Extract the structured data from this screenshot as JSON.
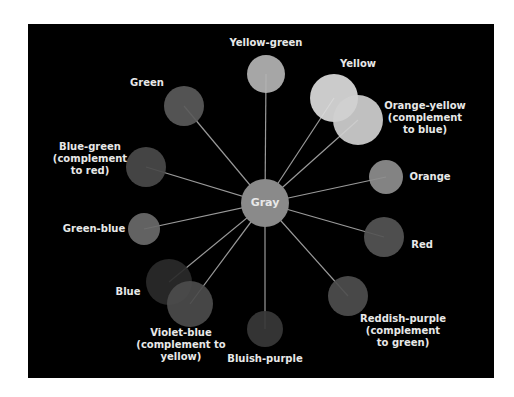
{
  "diagram": {
    "center": {
      "label": "Gray",
      "x": 265,
      "y": 203,
      "r": 24,
      "color": "#8a8a8a"
    },
    "nodes": [
      {
        "id": "yellow-green",
        "label": "Yellow-green",
        "x": 266,
        "y": 74,
        "r": 19,
        "color": "#b4b4b4",
        "lx": 266,
        "ly": 43
      },
      {
        "id": "yellow",
        "label": "Yellow",
        "x": 334,
        "y": 98,
        "r": 24,
        "color": "#dcdcdc",
        "lx": 358,
        "ly": 64
      },
      {
        "id": "orange-yellow",
        "label": "Orange-yellow\n(complement\nto blue)",
        "x": 358,
        "y": 120,
        "r": 25,
        "color": "#d0d0d0",
        "lx": 425,
        "ly": 118
      },
      {
        "id": "green",
        "label": "Green",
        "x": 184,
        "y": 106,
        "r": 20,
        "color": "#5a5a5a",
        "lx": 147,
        "ly": 83
      },
      {
        "id": "blue-green",
        "label": "Blue-green\n(complement\nto red)",
        "x": 146,
        "y": 167,
        "r": 20,
        "color": "#4a4a4a",
        "lx": 90,
        "ly": 159
      },
      {
        "id": "orange",
        "label": "Orange",
        "x": 386,
        "y": 177,
        "r": 17,
        "color": "#8e8e8e",
        "lx": 430,
        "ly": 177
      },
      {
        "id": "green-blue",
        "label": "Green-blue",
        "x": 144,
        "y": 229,
        "r": 16,
        "color": "#6a6a6a",
        "lx": 94,
        "ly": 229
      },
      {
        "id": "red",
        "label": "Red",
        "x": 384,
        "y": 237,
        "r": 20,
        "color": "#555555",
        "lx": 422,
        "ly": 245
      },
      {
        "id": "blue",
        "label": "Blue",
        "x": 169,
        "y": 282,
        "r": 23,
        "color": "#2a2a2a",
        "lx": 128,
        "ly": 292
      },
      {
        "id": "violet-blue",
        "label": "Violet-blue\n(complement to\nyellow)",
        "x": 190,
        "y": 304,
        "r": 23,
        "color": "#4c4c4c",
        "lx": 181,
        "ly": 345
      },
      {
        "id": "bluish-purple",
        "label": "Bluish-purple",
        "x": 265,
        "y": 329,
        "r": 18,
        "color": "#383838",
        "lx": 265,
        "ly": 359
      },
      {
        "id": "reddish-purple",
        "label": "Reddish-purple\n(complement\nto green)",
        "x": 348,
        "y": 296,
        "r": 20,
        "color": "#4e4e4e",
        "lx": 403,
        "ly": 331
      }
    ],
    "line_color": "#9a9a9a"
  }
}
